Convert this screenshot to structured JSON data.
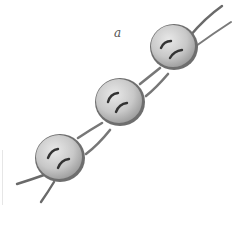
{
  "figure": {
    "label": "a",
    "button_count": 3,
    "holes_per_button": 4
  },
  "colors": {
    "background": "#ffffff",
    "button_face": "#c9c9c9",
    "button_highlight": "#e4e4e4",
    "button_rim": "#6a6a6a",
    "cord": "#8a8a8a",
    "cord_dark": "#4a4a4a",
    "thread": "#3a3a3a",
    "label": "#555555"
  },
  "buttons": [
    {
      "name": "top"
    },
    {
      "name": "middle"
    },
    {
      "name": "bottom"
    }
  ]
}
